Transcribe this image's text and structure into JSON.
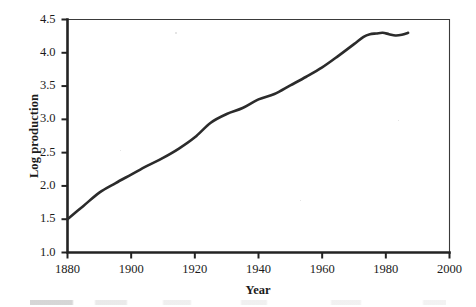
{
  "chart_data": {
    "type": "line",
    "title": "",
    "xlabel": "Year",
    "ylabel": "Log production",
    "xlim": [
      1880,
      2000
    ],
    "ylim": [
      1.0,
      4.5
    ],
    "grid": false,
    "legend": null,
    "xticks": [
      1880,
      1900,
      1920,
      1940,
      1960,
      1980,
      2000
    ],
    "xtick_labels": [
      "1880",
      "1900",
      "1920",
      "1940",
      "1960",
      "1980",
      "2000"
    ],
    "yticks": [
      1.0,
      1.5,
      2.0,
      2.5,
      3.0,
      3.5,
      4.0,
      4.5
    ],
    "ytick_labels": [
      "1.0",
      "1.5",
      "2.0",
      "2.5",
      "3.0",
      "3.5",
      "4.0",
      "4.5"
    ],
    "series": [
      {
        "name": "Log production",
        "color": "#2b2b2b",
        "line_width": 2.6,
        "x": [
          1880,
          1885,
          1890,
          1895,
          1900,
          1905,
          1910,
          1915,
          1920,
          1925,
          1930,
          1935,
          1940,
          1945,
          1950,
          1955,
          1960,
          1965,
          1970,
          1973,
          1975,
          1977,
          1979,
          1981,
          1983,
          1985,
          1987
        ],
        "y": [
          1.5,
          1.7,
          1.9,
          2.04,
          2.17,
          2.3,
          2.42,
          2.56,
          2.73,
          2.95,
          3.08,
          3.17,
          3.3,
          3.38,
          3.51,
          3.64,
          3.78,
          3.95,
          4.13,
          4.24,
          4.28,
          4.29,
          4.3,
          4.28,
          4.26,
          4.27,
          4.3
        ]
      }
    ]
  },
  "axes": {
    "y_title": "Log production",
    "x_title": "Year"
  }
}
